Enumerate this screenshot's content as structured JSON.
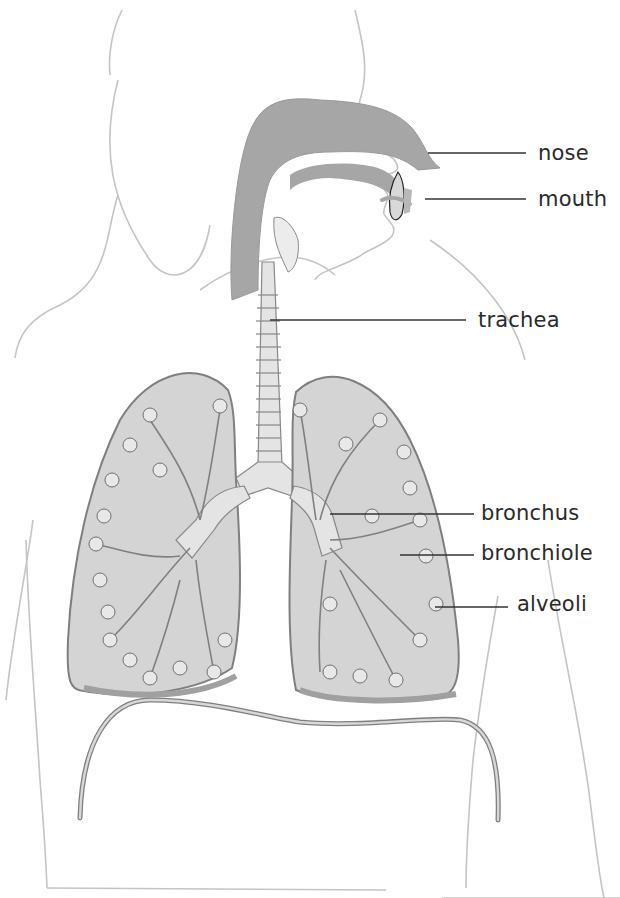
{
  "diagram": {
    "colors": {
      "airway_dark": "#a6a6a6",
      "lung_fill": "#d4d4d4",
      "lung_edge": "#7f7f7f",
      "outline": "#c4c4c4",
      "leader_line": "#333333",
      "label_text": "#2a2a2a",
      "background": "#ffffff"
    },
    "labels": [
      {
        "id": "nose",
        "text": "nose",
        "x": 538,
        "y": 143,
        "leader": {
          "from": [
            428,
            153
          ],
          "to": [
            526,
            153
          ]
        }
      },
      {
        "id": "mouth",
        "text": "mouth",
        "x": 538,
        "y": 189,
        "leader": {
          "from": [
            425,
            199
          ],
          "to": [
            526,
            199
          ]
        }
      },
      {
        "id": "trachea",
        "text": "trachea",
        "x": 478,
        "y": 310,
        "leader": {
          "from": [
            270,
            320
          ],
          "to": [
            466,
            320
          ]
        }
      },
      {
        "id": "bronchus",
        "text": "bronchus",
        "x": 481,
        "y": 503,
        "leader": {
          "from": [
            330,
            514
          ],
          "to": [
            474,
            514
          ]
        }
      },
      {
        "id": "bronchiole",
        "text": "bronchiole",
        "x": 481,
        "y": 543,
        "leader": {
          "from": [
            400,
            555
          ],
          "to": [
            474,
            555
          ]
        }
      },
      {
        "id": "alveoli",
        "text": "alveoli",
        "x": 517,
        "y": 594,
        "leader": {
          "from": [
            435,
            607
          ],
          "to": [
            508,
            607
          ]
        }
      }
    ]
  }
}
